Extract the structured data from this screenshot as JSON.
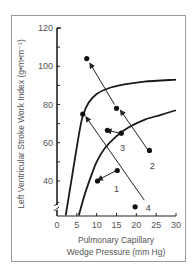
{
  "chart_data": {
    "type": "scatter",
    "title": "",
    "xlabel_lines": [
      "Pulmonary Capillary",
      "Wedge Pressure (mm Hg)"
    ],
    "ylabel": "Left Ventricular Stroke Work Index (g•m•m⁻²)",
    "xlim": [
      0,
      30
    ],
    "ylim": [
      22,
      120
    ],
    "y_axis_break": true,
    "x_ticks": [
      0,
      5,
      10,
      15,
      20,
      25,
      30
    ],
    "x_tick_labels": [
      "0",
      "5",
      "10",
      "15",
      "20",
      "25",
      "30"
    ],
    "y_ticks": [
      40,
      50,
      60,
      70,
      80,
      90,
      100,
      110,
      120
    ],
    "y_tick_labels": [
      {
        "value": 40,
        "label": "40"
      },
      {
        "value": 60,
        "label": "60"
      },
      {
        "value": 80,
        "label": "80"
      },
      {
        "value": 100,
        "label": "100"
      },
      {
        "value": 120,
        "label": "120"
      }
    ],
    "grid": false,
    "curves": [
      {
        "name": "upper-curve",
        "points": [
          [
            2.2,
            22
          ],
          [
            4,
            45
          ],
          [
            5.5,
            64
          ],
          [
            6.5,
            74
          ],
          [
            8,
            81
          ],
          [
            10,
            85.5
          ],
          [
            13,
            88.5
          ],
          [
            17,
            90.5
          ],
          [
            22,
            92
          ],
          [
            30,
            93
          ]
        ]
      },
      {
        "name": "lower-curve",
        "points": [
          [
            5.5,
            22
          ],
          [
            7,
            33
          ],
          [
            8.5,
            42
          ],
          [
            10,
            50
          ],
          [
            12,
            57
          ],
          [
            15,
            63.5
          ],
          [
            18,
            68
          ],
          [
            22,
            72
          ],
          [
            26,
            74.5
          ],
          [
            30,
            77
          ]
        ]
      }
    ],
    "arrows": [
      {
        "label": "1",
        "from": [
          15,
          45.5
        ],
        "to": [
          10.3,
          40.5
        ],
        "label_pos": [
          15,
          36
        ]
      },
      {
        "label": "2",
        "from": [
          23,
          56
        ],
        "to": [
          16,
          77
        ],
        "label_pos": [
          24,
          48
        ]
      },
      {
        "label": "3",
        "from": [
          16,
          65
        ],
        "to": [
          12.5,
          66.5
        ],
        "label_pos": [
          16.5,
          57
        ]
      },
      {
        "label": "4",
        "from": [
          22,
          30
        ],
        "to": [
          7.3,
          73.5
        ],
        "label_pos": [
          23,
          26
        ]
      },
      {
        "label": "",
        "from": [
          14.5,
          80
        ],
        "to": [
          8.3,
          101.5
        ],
        "label_pos": null
      }
    ],
    "points": [
      {
        "x": 7.5,
        "y": 104
      },
      {
        "x": 6.5,
        "y": 75
      },
      {
        "x": 15,
        "y": 78
      },
      {
        "x": 23.3,
        "y": 56
      },
      {
        "x": 12.7,
        "y": 66.5
      },
      {
        "x": 16.2,
        "y": 65
      },
      {
        "x": 10.2,
        "y": 40
      },
      {
        "x": 15.2,
        "y": 45.5
      },
      {
        "x": 19.7,
        "y": 26.5
      }
    ]
  }
}
